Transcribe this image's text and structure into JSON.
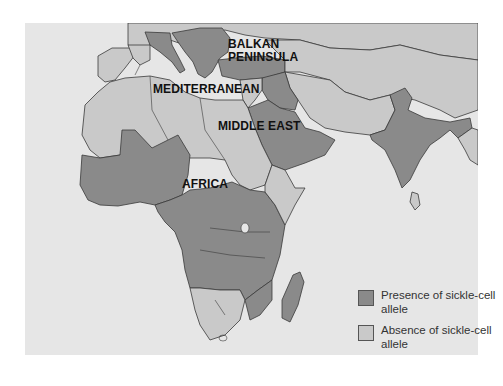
{
  "map": {
    "colors": {
      "page_background": "#ffffff",
      "ocean": "#e6e6e6",
      "absence": "#c9c9c9",
      "presence": "#8a8a8a",
      "border": "#3a3a3a"
    },
    "labels": {
      "balkan_line1": "BALKAN",
      "balkan_line2": "PENINSULA",
      "mediterranean": "MEDITERRANEAN",
      "middle_east": "MIDDLE EAST",
      "africa": "AFRICA"
    }
  },
  "legend": {
    "items": [
      {
        "label": "Presence of sickle-cell allele",
        "color": "#8a8a8a"
      },
      {
        "label": "Absence of sickle-cell allele",
        "color": "#c9c9c9"
      }
    ]
  }
}
